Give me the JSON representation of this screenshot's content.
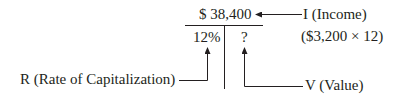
{
  "diagram": {
    "income_value": "$ 38,400",
    "income_label": "I (Income)",
    "income_calc": "($3,200 × 12)",
    "rate_value": "12%",
    "value_unknown": "?",
    "rate_label": "R (Rate of Capitalization)",
    "value_label": "V (Value)"
  },
  "colors": {
    "ink": "#231f20",
    "background": "#ffffff"
  }
}
